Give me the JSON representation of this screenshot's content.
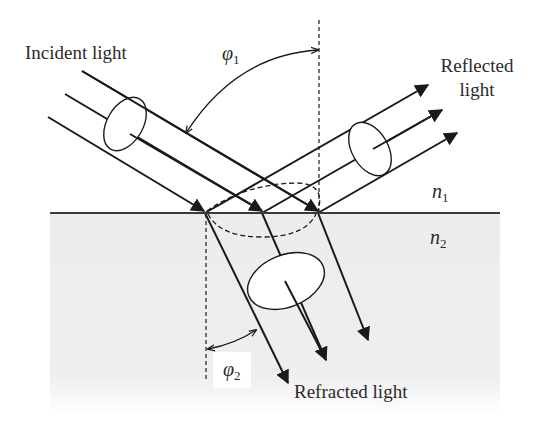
{
  "diagram": {
    "type": "optics-reflection-refraction",
    "labels": {
      "incident": "Incident light",
      "reflected_line1": "Reflected",
      "reflected_line2": "light",
      "refracted": "Refracted light",
      "phi1_symbol": "φ",
      "phi1_sub": "1",
      "phi2_symbol": "φ",
      "phi2_sub": "2",
      "n1_symbol": "n",
      "n1_sub": "1",
      "n2_symbol": "n",
      "n2_sub": "2"
    },
    "colors": {
      "line": "#1a1a1a",
      "medium2_fill": "#ededed",
      "background": "#ffffff",
      "text": "#2a2a2a"
    },
    "elements": [
      "incident beam (3 rays + polarization ellipse)",
      "reflected beam (3 rays + polarization ellipse)",
      "refracted beam (3 rays + polarization ellipse)",
      "interface line between n1 and n2",
      "surface normals (dashed)",
      "angle of incidence arc φ1",
      "angle of refraction arc φ2",
      "dashed beam footprint ellipse at interface"
    ]
  }
}
